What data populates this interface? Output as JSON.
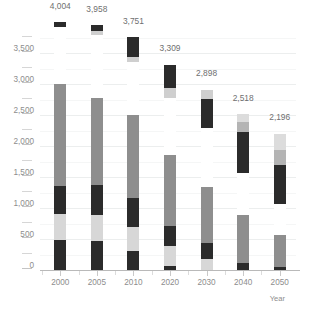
{
  "chart_data": {
    "type": "bar",
    "stacked": true,
    "title": "",
    "xlabel": "Year",
    "ylabel": "",
    "categories": [
      "2000",
      "2005",
      "2010",
      "2020",
      "2030",
      "2040",
      "2050"
    ],
    "ylim": [
      0,
      4200
    ],
    "yticks": [
      0,
      500,
      1000,
      1500,
      2000,
      2500,
      3000,
      3500
    ],
    "ytick_labels": [
      "0",
      "500",
      "1,000",
      "1,500",
      "2,000",
      "2,500",
      "3,000",
      "3,500"
    ],
    "minor_yticks": [
      250,
      750,
      1250,
      1750,
      2250,
      2750,
      3250,
      3750
    ],
    "grid": true,
    "legend": "none",
    "totals": [
      4004,
      3958,
      3751,
      3309,
      2898,
      2518,
      2196
    ],
    "total_labels": [
      "4,004",
      "3,958",
      "3,751",
      "3,309",
      "2,898",
      "2,518",
      "2,196"
    ],
    "series": [
      {
        "name": "segment-1-dark",
        "color": "#2b2b2b",
        "values": [
          490,
          470,
          310,
          40,
          150,
          90,
          45
        ]
      },
      {
        "name": "segment-2-light",
        "color": "#d8d8d8",
        "values": [
          400,
          400,
          390,
          330,
          215,
          0,
          0
        ]
      },
      {
        "name": "segment-3-dark",
        "color": "#2b2b2b",
        "values": [
          450,
          450,
          460,
          340,
          250,
          0,
          0
        ]
      },
      {
        "name": "segment-4-gray",
        "color": "#8e8e8e",
        "values": [
          1660,
          1450,
          1380,
          1180,
          740,
          790,
          510
        ]
      },
      {
        "name": "segment-5-gap",
        "color": "#ffffff",
        "values": [
          0,
          0,
          0,
          0,
          0,
          0,
          0
        ]
      }
    ],
    "bars": [
      {
        "year": "2000",
        "total": 4004,
        "total_label": "4,004",
        "label_y_value": 4180,
        "segments": [
          {
            "name": "base-dark",
            "color": "#2b2b2b",
            "from": 0,
            "to": 490
          },
          {
            "name": "light-gray",
            "color": "#d7d7d7",
            "from": 490,
            "to": 900
          },
          {
            "name": "mid-dark",
            "color": "#2b2b2b",
            "from": 900,
            "to": 1360
          },
          {
            "name": "tall-gray",
            "color": "#8e8e8e",
            "from": 1360,
            "to": 3000
          },
          {
            "name": "gap",
            "color": "#ffffff",
            "from": 3000,
            "to": 3920
          },
          {
            "name": "cap-dark",
            "color": "#2b2b2b",
            "from": 3920,
            "to": 4004
          }
        ]
      },
      {
        "year": "2005",
        "total": 3958,
        "total_label": "3,958",
        "label_y_value": 4130,
        "segments": [
          {
            "name": "base-dark",
            "color": "#2b2b2b",
            "from": 0,
            "to": 470
          },
          {
            "name": "light-gray",
            "color": "#d7d7d7",
            "from": 470,
            "to": 890
          },
          {
            "name": "mid-dark",
            "color": "#2b2b2b",
            "from": 890,
            "to": 1370
          },
          {
            "name": "tall-gray",
            "color": "#8e8e8e",
            "from": 1370,
            "to": 2780
          },
          {
            "name": "gap",
            "color": "#ffffff",
            "from": 2780,
            "to": 3790
          },
          {
            "name": "cap-light",
            "color": "#cfcfcf",
            "from": 3790,
            "to": 3850
          },
          {
            "name": "cap-dark",
            "color": "#2b2b2b",
            "from": 3850,
            "to": 3958
          }
        ]
      },
      {
        "year": "2010",
        "total": 3751,
        "total_label": "3,751",
        "label_y_value": 3930,
        "segments": [
          {
            "name": "base-dark",
            "color": "#2b2b2b",
            "from": 0,
            "to": 310
          },
          {
            "name": "light-gray",
            "color": "#d7d7d7",
            "from": 310,
            "to": 700
          },
          {
            "name": "mid-dark",
            "color": "#2b2b2b",
            "from": 700,
            "to": 1160
          },
          {
            "name": "tall-gray",
            "color": "#8e8e8e",
            "from": 1160,
            "to": 2500
          },
          {
            "name": "gap",
            "color": "#ffffff",
            "from": 2500,
            "to": 3360
          },
          {
            "name": "cap-light",
            "color": "#cfcfcf",
            "from": 3360,
            "to": 3430
          },
          {
            "name": "cap-dark",
            "color": "#2b2b2b",
            "from": 3430,
            "to": 3751
          }
        ]
      },
      {
        "year": "2020",
        "total": 3309,
        "total_label": "3,309",
        "label_y_value": 3500,
        "segments": [
          {
            "name": "base-dark",
            "color": "#2b2b2b",
            "from": 0,
            "to": 60
          },
          {
            "name": "light-gray",
            "color": "#d7d7d7",
            "from": 60,
            "to": 390
          },
          {
            "name": "mid-dark",
            "color": "#2b2b2b",
            "from": 390,
            "to": 710
          },
          {
            "name": "tall-gray",
            "color": "#8e8e8e",
            "from": 710,
            "to": 1860
          },
          {
            "name": "gap",
            "color": "#ffffff",
            "from": 1860,
            "to": 2770
          },
          {
            "name": "cap-light",
            "color": "#cfcfcf",
            "from": 2770,
            "to": 2930
          },
          {
            "name": "cap-dark",
            "color": "#2b2b2b",
            "from": 2930,
            "to": 3309
          }
        ]
      },
      {
        "year": "2030",
        "total": 2898,
        "total_label": "2,898",
        "label_y_value": 3090,
        "segments": [
          {
            "name": "base-light",
            "color": "#d7d7d7",
            "from": 0,
            "to": 180
          },
          {
            "name": "mid-dark",
            "color": "#2b2b2b",
            "from": 180,
            "to": 430
          },
          {
            "name": "tall-gray",
            "color": "#8e8e8e",
            "from": 430,
            "to": 1345
          },
          {
            "name": "gap",
            "color": "#ffffff",
            "from": 1345,
            "to": 2290
          },
          {
            "name": "cap-dark",
            "color": "#2b2b2b",
            "from": 2290,
            "to": 2760
          },
          {
            "name": "cap-light",
            "color": "#cfcfcf",
            "from": 2760,
            "to": 2898
          }
        ]
      },
      {
        "year": "2040",
        "total": 2518,
        "total_label": "2,518",
        "label_y_value": 2700,
        "segments": [
          {
            "name": "base-dark",
            "color": "#2b2b2b",
            "from": 0,
            "to": 110
          },
          {
            "name": "tall-gray",
            "color": "#8e8e8e",
            "from": 110,
            "to": 885
          },
          {
            "name": "gap",
            "color": "#ffffff",
            "from": 885,
            "to": 1565
          },
          {
            "name": "cap-dark",
            "color": "#2b2b2b",
            "from": 1565,
            "to": 2220
          },
          {
            "name": "cap-mid",
            "color": "#b4b4b4",
            "from": 2220,
            "to": 2380
          },
          {
            "name": "cap-light",
            "color": "#dcdcdc",
            "from": 2380,
            "to": 2518
          }
        ]
      },
      {
        "year": "2050",
        "total": 2196,
        "total_label": "2,196",
        "label_y_value": 2380,
        "segments": [
          {
            "name": "base-dark",
            "color": "#2b2b2b",
            "from": 0,
            "to": 55
          },
          {
            "name": "tall-gray",
            "color": "#8e8e8e",
            "from": 55,
            "to": 565
          },
          {
            "name": "gap",
            "color": "#ffffff",
            "from": 565,
            "to": 1070
          },
          {
            "name": "cap-dark",
            "color": "#2b2b2b",
            "from": 1070,
            "to": 1700
          },
          {
            "name": "cap-mid",
            "color": "#b4b4b4",
            "from": 1700,
            "to": 1940
          },
          {
            "name": "cap-light",
            "color": "#dcdcdc",
            "from": 1940,
            "to": 2196
          }
        ]
      }
    ]
  }
}
